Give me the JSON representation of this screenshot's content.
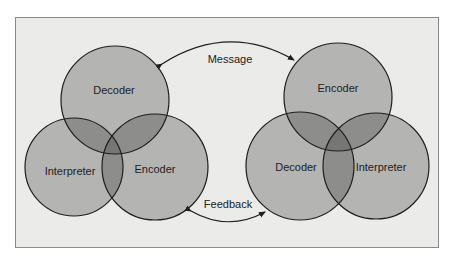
{
  "diagram": {
    "type": "communication-model",
    "colors": {
      "background": "#ebebea",
      "circle_fill": "#b4b4b2",
      "overlap_fill": "#8d8d8b",
      "center_fill": "#767674",
      "stroke": "#1e1e1e"
    },
    "left_group": {
      "circles": [
        {
          "label": "Decoder",
          "cx": 115,
          "cy": 100,
          "r": 54
        },
        {
          "label": "Interpreter",
          "cx": 74,
          "cy": 167,
          "r": 49
        },
        {
          "label": "Encoder",
          "cx": 155,
          "cy": 167,
          "r": 53
        }
      ]
    },
    "right_group": {
      "circles": [
        {
          "label": "Encoder",
          "cx": 338,
          "cy": 97,
          "r": 54
        },
        {
          "label": "Decoder",
          "cx": 300,
          "cy": 166,
          "r": 54
        },
        {
          "label": "Interpreter",
          "cx": 376,
          "cy": 166,
          "r": 53
        }
      ]
    },
    "arrows": [
      {
        "label": "Message",
        "from": "right_group",
        "to": "left_group"
      },
      {
        "label": "Feedback",
        "from": "left_group",
        "to": "right_group"
      }
    ]
  }
}
